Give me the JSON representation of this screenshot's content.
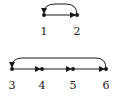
{
  "graphs": [
    {
      "name": "top-graph",
      "nodes": [
        {
          "id": "1",
          "label": "1",
          "x": 44,
          "y": 15
        },
        {
          "id": "2",
          "label": "2",
          "x": 77,
          "y": 15
        }
      ],
      "edges": [
        {
          "from": "1",
          "to": "2",
          "type": "straight"
        },
        {
          "from": "2",
          "to": "1",
          "type": "arc"
        }
      ]
    },
    {
      "name": "bottom-graph",
      "nodes": [
        {
          "id": "3",
          "label": "3",
          "x": 12,
          "y": 69
        },
        {
          "id": "4",
          "label": "4",
          "x": 42,
          "y": 69
        },
        {
          "id": "5",
          "label": "5",
          "x": 73,
          "y": 69
        },
        {
          "id": "6",
          "label": "6",
          "x": 106,
          "y": 69
        }
      ],
      "edges": [
        {
          "from": "3",
          "to": "4",
          "type": "straight"
        },
        {
          "from": "4",
          "to": "5",
          "type": "straight"
        },
        {
          "from": "5",
          "to": "6",
          "type": "straight"
        },
        {
          "from": "6",
          "to": "3",
          "type": "arc"
        }
      ]
    }
  ],
  "colors": {
    "stroke": "#1a1a1a",
    "background": "#ffffff"
  }
}
